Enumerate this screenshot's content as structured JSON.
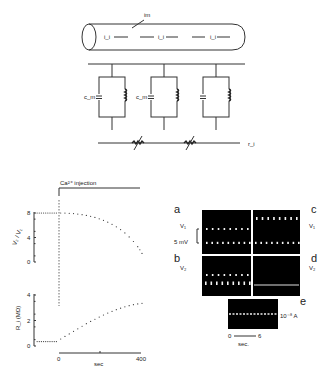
{
  "figure": {
    "cable_diagram": {
      "membrane_current_label": "im",
      "axial_current_labels": [
        "i_i",
        "i_i",
        "i_i"
      ],
      "capacitor_labels": [
        "c_m",
        "c_m",
        ""
      ],
      "resistor_label": "r_m",
      "junction_resistance_label": "r_i"
    },
    "injection": {
      "label": "Ca²⁺ injection"
    },
    "scope_traces": {
      "panel_labels": [
        "a",
        "b",
        "c",
        "d",
        "e"
      ],
      "voltage_labels": [
        "V₁",
        "V₂",
        "V₁",
        "V₂"
      ],
      "scale_voltage": "5 mV",
      "scale_current": "10⁻⁸ A",
      "time_scale_start": "0",
      "time_scale_end": "6",
      "time_unit": "sec."
    }
  },
  "chart_data": [
    {
      "type": "scatter",
      "title": "",
      "ylabel": "V₂ / V₁",
      "xlabel": "",
      "ylim": [
        0,
        8
      ],
      "yticks": [
        "0",
        "4",
        "8"
      ],
      "xlim": [
        -100,
        400
      ],
      "series": [
        {
          "name": "V2/V1",
          "x": [
            -90,
            -80,
            -70,
            -60,
            -50,
            -40,
            -30,
            -20,
            -10,
            0,
            20,
            40,
            60,
            80,
            100,
            120,
            140,
            160,
            180,
            200,
            220,
            240,
            260,
            280,
            300,
            320,
            340,
            360,
            380,
            390,
            400
          ],
          "y": [
            8,
            8,
            8,
            8,
            8,
            8,
            8,
            8,
            8,
            8,
            8,
            7.98,
            7.95,
            7.9,
            7.82,
            7.72,
            7.6,
            7.45,
            7.27,
            7.05,
            6.8,
            6.5,
            6.15,
            5.75,
            5.3,
            4.75,
            4.1,
            3.35,
            2.5,
            2.0,
            1.4
          ]
        }
      ]
    },
    {
      "type": "scatter",
      "title": "",
      "ylabel": "R_i (MΩ)",
      "xlabel": "sec",
      "ylim": [
        0,
        4
      ],
      "yticks": [
        "0",
        "2",
        "4"
      ],
      "xlim": [
        -100,
        400
      ],
      "xticks": [
        "0",
        "400"
      ],
      "series": [
        {
          "name": "R_i",
          "x": [
            -90,
            -80,
            -70,
            -60,
            -50,
            -40,
            -30,
            -20,
            -10,
            0,
            20,
            40,
            60,
            80,
            100,
            120,
            140,
            160,
            180,
            200,
            220,
            240,
            260,
            280,
            300,
            320,
            340,
            360,
            380,
            400
          ],
          "y": [
            0.35,
            0.35,
            0.35,
            0.35,
            0.35,
            0.35,
            0.35,
            0.35,
            0.35,
            0.35,
            0.55,
            0.75,
            0.95,
            1.15,
            1.35,
            1.55,
            1.75,
            1.93,
            2.1,
            2.27,
            2.43,
            2.58,
            2.72,
            2.85,
            2.97,
            3.07,
            3.16,
            3.24,
            3.3,
            3.35
          ]
        }
      ]
    }
  ]
}
